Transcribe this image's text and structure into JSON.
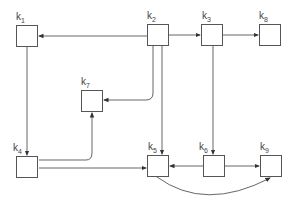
{
  "diagram": {
    "type": "directed-graph",
    "nodes": [
      {
        "id": "k1",
        "label": "k",
        "sub": "1"
      },
      {
        "id": "k2",
        "label": "k",
        "sub": "2"
      },
      {
        "id": "k3",
        "label": "k",
        "sub": "3"
      },
      {
        "id": "k8",
        "label": "k",
        "sub": "8"
      },
      {
        "id": "k7",
        "label": "k",
        "sub": "7"
      },
      {
        "id": "k4",
        "label": "k",
        "sub": "4"
      },
      {
        "id": "k5",
        "label": "k",
        "sub": "5"
      },
      {
        "id": "k6",
        "label": "k",
        "sub": "6"
      },
      {
        "id": "k9",
        "label": "k",
        "sub": "9"
      }
    ],
    "edges": [
      {
        "from": "k2",
        "to": "k1"
      },
      {
        "from": "k2",
        "to": "k3"
      },
      {
        "from": "k3",
        "to": "k8"
      },
      {
        "from": "k2",
        "to": "k7"
      },
      {
        "from": "k2",
        "to": "k5"
      },
      {
        "from": "k3",
        "to": "k6"
      },
      {
        "from": "k1",
        "to": "k4"
      },
      {
        "from": "k4",
        "to": "k7"
      },
      {
        "from": "k4",
        "to": "k5"
      },
      {
        "from": "k6",
        "to": "k5"
      },
      {
        "from": "k6",
        "to": "k9"
      },
      {
        "from": "k5",
        "to": "k9"
      }
    ]
  }
}
